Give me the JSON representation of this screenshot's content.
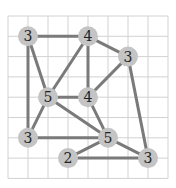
{
  "puzzle": {
    "type": "hashi-style graph degree puzzle",
    "grid": {
      "cols": 8,
      "rows": 8,
      "x0": 8,
      "y0": 16,
      "cell_w": 20,
      "cell_h": 20.3,
      "line_color": "#d2d2d2"
    },
    "node_color": "#c4c4c4",
    "edge_color": "#7a7a7a",
    "nodes": [
      {
        "id": "n1",
        "label": "3",
        "gx": 1,
        "gy": 1
      },
      {
        "id": "n2",
        "label": "4",
        "gx": 4,
        "gy": 1
      },
      {
        "id": "n3",
        "label": "3",
        "gx": 6,
        "gy": 2
      },
      {
        "id": "n4",
        "label": "5",
        "gx": 2,
        "gy": 4
      },
      {
        "id": "n5",
        "label": "4",
        "gx": 4,
        "gy": 4
      },
      {
        "id": "n6",
        "label": "3",
        "gx": 1,
        "gy": 6
      },
      {
        "id": "n7",
        "label": "5",
        "gx": 5,
        "gy": 6
      },
      {
        "id": "n8",
        "label": "2",
        "gx": 3,
        "gy": 7
      },
      {
        "id": "n9",
        "label": "3",
        "gx": 7,
        "gy": 7
      }
    ],
    "edges": [
      [
        "n1",
        "n2"
      ],
      [
        "n1",
        "n4"
      ],
      [
        "n1",
        "n6"
      ],
      [
        "n2",
        "n4"
      ],
      [
        "n2",
        "n5"
      ],
      [
        "n2",
        "n3"
      ],
      [
        "n3",
        "n5"
      ],
      [
        "n3",
        "n9"
      ],
      [
        "n4",
        "n5"
      ],
      [
        "n4",
        "n6"
      ],
      [
        "n4",
        "n7"
      ],
      [
        "n5",
        "n7"
      ],
      [
        "n6",
        "n7"
      ],
      [
        "n7",
        "n8"
      ],
      [
        "n7",
        "n9"
      ],
      [
        "n8",
        "n9"
      ]
    ]
  }
}
